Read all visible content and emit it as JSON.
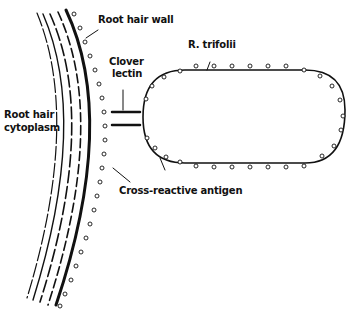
{
  "diagram": {
    "labels": {
      "root_hair_wall": "Root hair wall",
      "r_trifolii": "R. trifolii",
      "clover_lectin_line1": "Clover",
      "clover_lectin_line2": "lectin",
      "root_hair_cytoplasm_line1": "Root hair",
      "root_hair_cytoplasm_line2": "cytoplasm",
      "cross_reactive_antigen": "Cross-reactive antigen"
    },
    "colors": {
      "ink": "#111111",
      "background": "#ffffff"
    }
  }
}
